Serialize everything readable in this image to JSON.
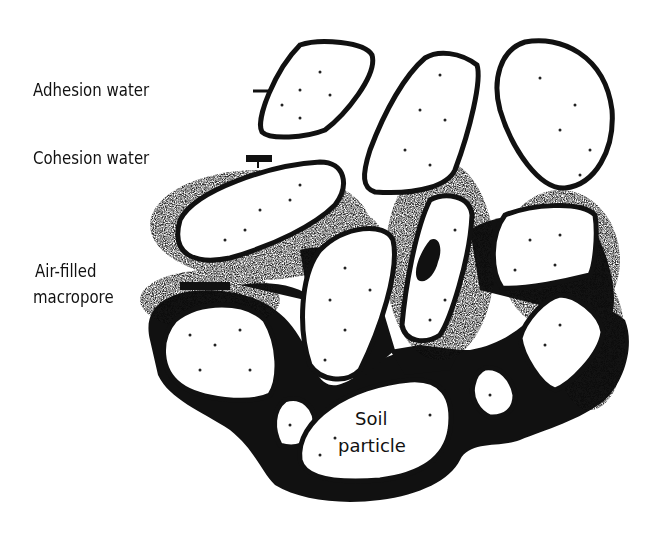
{
  "diagram": {
    "type": "soil-water-schematic",
    "labels": {
      "adhesion_water": "Adhesion water",
      "cohesion_water": "Cohesion water",
      "air_filled_line1": "Air-filled",
      "air_filled_line2": "macropore",
      "soil_particle_line1": "Soil",
      "soil_particle_line2": "particle"
    },
    "colors": {
      "ink": "#111111",
      "background": "#ffffff",
      "particle_fill": "#ffffff"
    }
  }
}
